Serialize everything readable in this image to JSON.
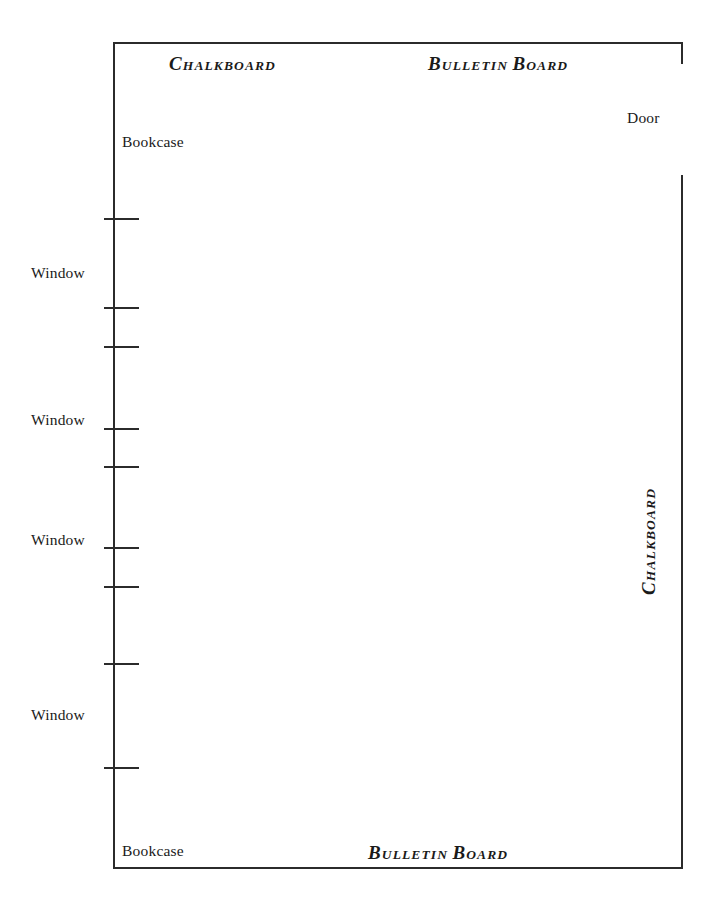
{
  "diagram": {
    "type": "classroom-floor-plan",
    "background_color": "#ffffff",
    "line_color": "#2b2b2b",
    "text_color": "#1a1a1a",
    "width": 714,
    "height": 900
  },
  "labels": {
    "chalkboard_top": {
      "lead": "C",
      "rest": "HALKBOARD"
    },
    "bulletin_board_top": {
      "lead_1": "B",
      "rest_1": "ULLETIN",
      "lead_2": "B",
      "rest_2": "OARD"
    },
    "bulletin_board_bottom": {
      "lead_1": "B",
      "rest_1": "ULLETIN",
      "lead_2": "B",
      "rest_2": "OARD"
    },
    "chalkboard_right": {
      "lead": "C",
      "rest": "HALKBOARD"
    },
    "door": "Door",
    "bookcase_top": "Bookcase",
    "bookcase_bottom": "Bookcase",
    "windows": [
      {
        "label": "Window"
      },
      {
        "label": "Window"
      },
      {
        "label": "Window"
      },
      {
        "label": "Window"
      }
    ]
  },
  "geometry": {
    "walls": [
      {
        "name": "top",
        "x": 113,
        "y": 42,
        "length": 570,
        "orientation": "horizontal"
      },
      {
        "name": "left",
        "x": 113,
        "y": 42,
        "length": 827,
        "orientation": "vertical"
      },
      {
        "name": "bottom",
        "x": 113,
        "y": 867,
        "length": 570,
        "orientation": "horizontal"
      },
      {
        "name": "right-stub",
        "x": 681,
        "y": 42,
        "length": 22,
        "orientation": "vertical"
      },
      {
        "name": "right",
        "x": 681,
        "y": 175,
        "length": 694,
        "orientation": "vertical"
      }
    ],
    "door_opening": {
      "x": 681,
      "y_start": 64,
      "y_end": 175
    },
    "window_ticks": [
      218,
      307,
      346,
      428,
      466,
      547,
      586,
      663,
      767
    ],
    "window_label_positions": [
      265,
      412,
      532,
      707
    ]
  }
}
